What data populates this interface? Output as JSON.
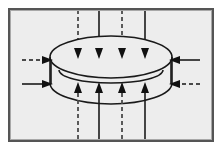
{
  "figure": {
    "title": "Toroid with vertical magnetic flux lines",
    "canvas": {
      "width": 222,
      "height": 150
    },
    "colors": {
      "page_background": "#ffffff",
      "panel_background": "#ededed",
      "frame_border": "#555555",
      "frame_border_light": "#a8a8a8",
      "stroke": "#1a1a1a",
      "dash_stroke": "#4a4a4a",
      "torus_stroke": "#1a1a1a"
    },
    "frame": {
      "x": 8,
      "y": 8,
      "width": 206,
      "height": 134,
      "border_width": 2
    },
    "torus": {
      "center_x": 111,
      "center_y": 70,
      "radius_x": 61,
      "radius_y": 21,
      "body_height": 26,
      "top_ellipse_cy": 57,
      "bottom_ellipse_cy": 83,
      "inner_ellipse_cy": 72,
      "inner_radius_x": 52,
      "inner_radius_y": 13
    },
    "vertical_lines": [
      {
        "id": "v1",
        "x": 78,
        "style": "dashed",
        "direction": "down-then-up",
        "label": "flux-line-1"
      },
      {
        "id": "v2",
        "x": 99,
        "style": "solid",
        "direction": "down-then-up",
        "label": "flux-line-2"
      },
      {
        "id": "v3",
        "x": 122,
        "style": "dashed",
        "direction": "down-then-up",
        "label": "flux-line-3"
      },
      {
        "id": "v4",
        "x": 145,
        "style": "solid",
        "direction": "down-then-up",
        "label": "flux-line-4"
      }
    ],
    "vertical_geometry": {
      "top_start_y": 10,
      "top_arrow_tip_y": 59,
      "bottom_arrow_tip_y": 82,
      "bottom_end_y": 139,
      "arrow_half_width": 4,
      "arrow_length": 11
    },
    "horizontal_arrows": [
      {
        "id": "h1",
        "side": "left",
        "style": "dashed",
        "y": 60,
        "x_start": 22,
        "x_tip": 52,
        "label": "left-upper-inflow"
      },
      {
        "id": "h2",
        "side": "left",
        "style": "solid",
        "y": 84,
        "x_start": 22,
        "x_tip": 52,
        "label": "left-lower-inflow"
      },
      {
        "id": "h3",
        "side": "right",
        "style": "solid",
        "y": 60,
        "x_start": 200,
        "x_tip": 170,
        "label": "right-upper-inflow"
      },
      {
        "id": "h4",
        "side": "right",
        "style": "dashed",
        "y": 84,
        "x_start": 200,
        "x_tip": 170,
        "label": "right-lower-inflow"
      }
    ],
    "side_connectors": [
      {
        "id": "s-left",
        "x": 52,
        "y_top": 60,
        "y_bottom": 84,
        "label": "left-rim-segment"
      },
      {
        "id": "s-right",
        "x": 170,
        "y_top": 60,
        "y_bottom": 84,
        "label": "right-rim-segment"
      }
    ],
    "strokes": {
      "line_width": 1.6,
      "torus_line_width": 1.5,
      "dash_pattern": "4,3"
    }
  }
}
